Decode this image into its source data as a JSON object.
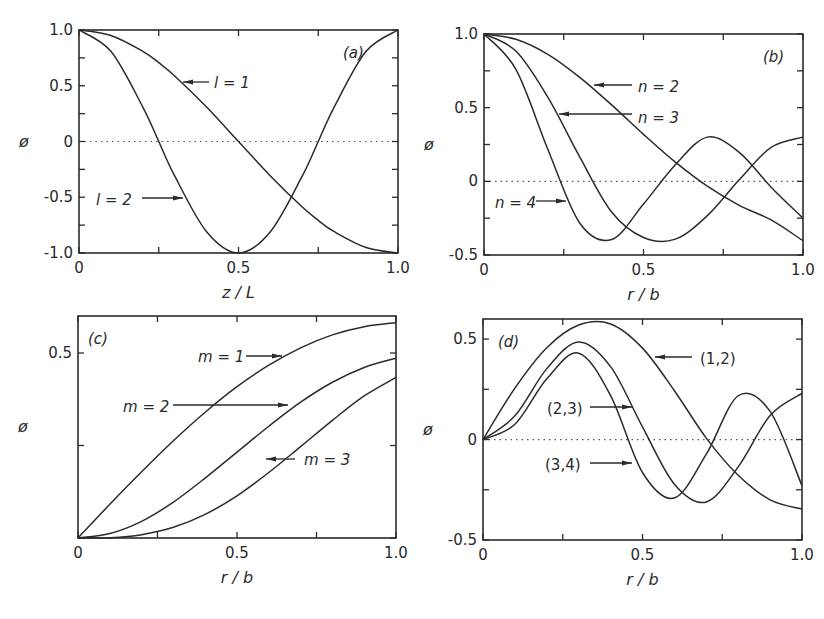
{
  "figure": {
    "panels": [
      {
        "id": "a",
        "tag": "(a)",
        "xlabel": "z / L",
        "ylabel": "ø",
        "frame": {
          "left": 79,
          "top": 30,
          "right": 398,
          "bottom": 253
        },
        "xlim": [
          0,
          1.0
        ],
        "ylim": [
          -1.0,
          1.0
        ],
        "xticks": [
          {
            "v": 0,
            "label": "0"
          },
          {
            "v": 0.25,
            "label": ""
          },
          {
            "v": 0.5,
            "label": "0.5"
          },
          {
            "v": 0.75,
            "label": ""
          },
          {
            "v": 1.0,
            "label": "1.0"
          }
        ],
        "yticks": [
          {
            "v": 1.0,
            "label": "1.0"
          },
          {
            "v": 0.75,
            "label": ""
          },
          {
            "v": 0.5,
            "label": "0.5"
          },
          {
            "v": 0.25,
            "label": ""
          },
          {
            "v": 0,
            "label": "0"
          },
          {
            "v": -0.25,
            "label": ""
          },
          {
            "v": -0.5,
            "label": "-0.5"
          },
          {
            "v": -0.75,
            "label": ""
          },
          {
            "v": -1.0,
            "label": "-1.0"
          }
        ],
        "zero_line": true,
        "annotations": [
          {
            "text": "l = 1",
            "x": 214,
            "y": 88,
            "arrow_from": [
              209,
              82
            ],
            "arrow_to": [
              183,
              82
            ]
          },
          {
            "text": "l = 2",
            "x": 96,
            "y": 205,
            "arrow_from": [
              142,
              198
            ],
            "arrow_to": [
              183,
              198
            ]
          }
        ]
      },
      {
        "id": "b",
        "tag": "(b)",
        "xlabel": "r / b",
        "ylabel": "ø",
        "frame": {
          "left": 484,
          "top": 34,
          "right": 803,
          "bottom": 255
        },
        "xlim": [
          0,
          1.0
        ],
        "ylim": [
          -0.5,
          1.0
        ],
        "xticks": [
          {
            "v": 0,
            "label": "0"
          },
          {
            "v": 0.25,
            "label": ""
          },
          {
            "v": 0.5,
            "label": "0.5"
          },
          {
            "v": 0.75,
            "label": ""
          },
          {
            "v": 1.0,
            "label": "1.0"
          }
        ],
        "yticks": [
          {
            "v": 1.0,
            "label": "1.0"
          },
          {
            "v": 0.75,
            "label": ""
          },
          {
            "v": 0.5,
            "label": "0.5"
          },
          {
            "v": 0.25,
            "label": ""
          },
          {
            "v": 0,
            "label": "0"
          },
          {
            "v": -0.25,
            "label": ""
          },
          {
            "v": -0.5,
            "label": "-0.5"
          }
        ],
        "zero_line": true,
        "annotations": [
          {
            "text": "n  = 2",
            "x": 638,
            "y": 92,
            "arrow_from": [
              632,
              85
            ],
            "arrow_to": [
              594,
              85
            ]
          },
          {
            "text": "n  = 3",
            "x": 638,
            "y": 123,
            "arrow_from": [
              632,
              114
            ],
            "arrow_to": [
              559,
              114
            ]
          },
          {
            "text": "n  = 4",
            "x": 495,
            "y": 208,
            "arrow_from": [
              536,
              201
            ],
            "arrow_to": [
              566,
              201
            ]
          }
        ]
      },
      {
        "id": "c",
        "tag": "(c)",
        "xlabel": "r / b",
        "ylabel": "ø",
        "frame": {
          "left": 78,
          "top": 316,
          "right": 396,
          "bottom": 538
        },
        "xlim": [
          0,
          1.0
        ],
        "ylim": [
          0,
          0.6
        ],
        "xticks": [
          {
            "v": 0,
            "label": "0"
          },
          {
            "v": 0.25,
            "label": ""
          },
          {
            "v": 0.5,
            "label": "0.5"
          },
          {
            "v": 0.75,
            "label": ""
          },
          {
            "v": 1.0,
            "label": "1.0"
          }
        ],
        "yticks": [
          {
            "v": 0.5,
            "label": "0.5"
          },
          {
            "v": 0.25,
            "label": ""
          },
          {
            "v": 0,
            "label": ""
          }
        ],
        "zero_line": false,
        "annotations": [
          {
            "text": "m  = 1",
            "x": 198,
            "y": 362,
            "arrow_from": [
              246,
              356
            ],
            "arrow_to": [
              282,
              356
            ]
          },
          {
            "text": "m  = 2",
            "x": 123,
            "y": 412,
            "arrow_from": [
              173,
              405
            ],
            "arrow_to": [
              288,
              405
            ]
          },
          {
            "text": "m  = 3",
            "x": 304,
            "y": 465,
            "arrow_from": [
              295,
              459
            ],
            "arrow_to": [
              266,
              459
            ]
          }
        ]
      },
      {
        "id": "d",
        "tag": "(d)",
        "xlabel": "r / b",
        "ylabel": "ø",
        "frame": {
          "left": 483,
          "top": 319,
          "right": 802,
          "bottom": 540
        },
        "xlim": [
          0,
          1.0
        ],
        "ylim": [
          -0.5,
          0.6
        ],
        "xticks": [
          {
            "v": 0,
            "label": "0"
          },
          {
            "v": 0.25,
            "label": ""
          },
          {
            "v": 0.5,
            "label": "0.5"
          },
          {
            "v": 0.75,
            "label": ""
          },
          {
            "v": 1.0,
            "label": "1.0"
          }
        ],
        "yticks": [
          {
            "v": 0.5,
            "label": "0.5"
          },
          {
            "v": 0.25,
            "label": ""
          },
          {
            "v": 0,
            "label": "0"
          },
          {
            "v": -0.25,
            "label": ""
          },
          {
            "v": -0.5,
            "label": "-0.5"
          }
        ],
        "zero_line": true,
        "annotations": [
          {
            "text": "(1,2)",
            "x": 700,
            "y": 364,
            "arrow_from": [
              692,
              357
            ],
            "arrow_to": [
              655,
              357
            ]
          },
          {
            "text": "(2,3)",
            "x": 547,
            "y": 414,
            "arrow_from": [
              590,
              407
            ],
            "arrow_to": [
              632,
              407
            ]
          },
          {
            "text": "(3,4)",
            "x": 545,
            "y": 470,
            "arrow_from": [
              590,
              463
            ],
            "arrow_to": [
              632,
              463
            ]
          }
        ]
      }
    ]
  },
  "chart_data": [
    {
      "type": "line",
      "title": "(a)",
      "xlabel": "z/L",
      "ylabel": "ø",
      "xlim": [
        0,
        1.0
      ],
      "ylim": [
        -1.0,
        1.0
      ],
      "grid": false,
      "x": [
        0,
        0.1,
        0.2,
        0.25,
        0.3,
        0.4,
        0.5,
        0.6,
        0.7,
        0.75,
        0.8,
        0.9,
        1.0
      ],
      "series": [
        {
          "name": "l = 1",
          "values": [
            1.0,
            0.951,
            0.809,
            0.707,
            0.588,
            0.309,
            0.0,
            -0.309,
            -0.588,
            -0.707,
            -0.809,
            -0.951,
            -1.0
          ]
        },
        {
          "name": "l = 2",
          "values": [
            1.0,
            0.809,
            0.309,
            0.0,
            -0.309,
            -0.809,
            -1.0,
            -0.809,
            -0.309,
            0.0,
            0.309,
            0.809,
            1.0
          ]
        }
      ]
    },
    {
      "type": "line",
      "title": "(b)",
      "xlabel": "r/b",
      "ylabel": "ø",
      "xlim": [
        0,
        1.0
      ],
      "ylim": [
        -0.5,
        1.0
      ],
      "grid": false,
      "x": [
        0,
        0.1,
        0.2,
        0.3,
        0.4,
        0.5,
        0.6,
        0.7,
        0.8,
        0.9,
        1.0
      ],
      "series": [
        {
          "name": "n = 2",
          "values": [
            1.0,
            0.964,
            0.862,
            0.706,
            0.519,
            0.319,
            0.13,
            -0.033,
            -0.163,
            -0.262,
            -0.403
          ]
        },
        {
          "name": "n = 3",
          "values": [
            1.0,
            0.884,
            0.571,
            0.166,
            -0.208,
            -0.381,
            -0.392,
            -0.233,
            0.01,
            0.23,
            0.3
          ]
        },
        {
          "name": "n = 4",
          "values": [
            1.0,
            0.76,
            0.218,
            -0.283,
            -0.395,
            -0.154,
            0.113,
            0.3,
            0.197,
            -0.04,
            -0.25
          ]
        }
      ]
    },
    {
      "type": "line",
      "title": "(c)",
      "xlabel": "r/b",
      "ylabel": "ø",
      "xlim": [
        0,
        1.0
      ],
      "ylim": [
        0,
        0.6
      ],
      "grid": false,
      "x": [
        0,
        0.1,
        0.2,
        0.3,
        0.4,
        0.5,
        0.6,
        0.7,
        0.8,
        0.9,
        1.0
      ],
      "series": [
        {
          "name": "m = 1",
          "values": [
            0.0,
            0.091,
            0.179,
            0.263,
            0.34,
            0.409,
            0.467,
            0.514,
            0.549,
            0.571,
            0.582
          ]
        },
        {
          "name": "m = 2",
          "values": [
            0.0,
            0.012,
            0.045,
            0.097,
            0.162,
            0.232,
            0.302,
            0.367,
            0.421,
            0.461,
            0.486
          ]
        },
        {
          "name": "m = 3",
          "values": [
            0.0,
            0.001,
            0.009,
            0.029,
            0.064,
            0.114,
            0.177,
            0.247,
            0.318,
            0.384,
            0.434
          ]
        }
      ]
    },
    {
      "type": "line",
      "title": "(d)",
      "xlabel": "r/b",
      "ylabel": "ø",
      "xlim": [
        0,
        1.0
      ],
      "ylim": [
        -0.5,
        0.6
      ],
      "grid": false,
      "x": [
        0,
        0.1,
        0.2,
        0.3,
        0.4,
        0.5,
        0.6,
        0.7,
        0.8,
        0.9,
        1.0
      ],
      "series": [
        {
          "name": "(1,2)",
          "values": [
            0.0,
            0.256,
            0.457,
            0.57,
            0.575,
            0.455,
            0.243,
            0.007,
            -0.178,
            -0.3,
            -0.346
          ]
        },
        {
          "name": "(2,3)",
          "values": [
            0.0,
            0.118,
            0.353,
            0.486,
            0.363,
            0.063,
            -0.222,
            -0.311,
            -0.136,
            0.12,
            0.23
          ]
        },
        {
          "name": "(3,4)",
          "values": [
            0.0,
            0.076,
            0.302,
            0.43,
            0.219,
            -0.164,
            -0.291,
            -0.073,
            0.218,
            0.14,
            -0.23
          ]
        }
      ]
    }
  ]
}
